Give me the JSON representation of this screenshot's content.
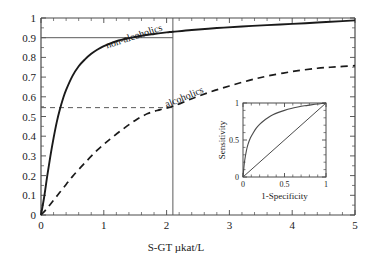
{
  "chart_data": [
    {
      "id": "main",
      "type": "line",
      "title": "",
      "xlabel": "S-GT µkat/L",
      "ylabel": "",
      "xlim": [
        0,
        5
      ],
      "ylim": [
        0,
        1
      ],
      "grid": false,
      "legend_position": "inline-curve-labels",
      "xticks": [
        0,
        1,
        2,
        3,
        4,
        5
      ],
      "xtick_labels": [
        "0",
        "1",
        "2",
        "3",
        "4",
        "5"
      ],
      "xminor_step": 0.2,
      "yticks": [
        0,
        0.1,
        0.2,
        0.3,
        0.4,
        0.5,
        0.6,
        0.7,
        0.8,
        0.9,
        1
      ],
      "ytick_labels": [
        "0",
        "0.1",
        "0.2",
        "0.3",
        "0.4",
        "0.5",
        "0.6",
        "0.7",
        "0.8",
        "0.9",
        "1"
      ],
      "yminor_step": 0.05,
      "series": [
        {
          "name": "non-alcoholics",
          "style": "solid",
          "label_text": "non-alcoholics",
          "label_rotation": -18,
          "x": [
            0,
            0.05,
            0.1,
            0.15,
            0.2,
            0.25,
            0.3,
            0.35,
            0.4,
            0.5,
            0.6,
            0.7,
            0.8,
            0.9,
            1.0,
            1.2,
            1.4,
            1.6,
            1.8,
            2.0,
            2.1,
            2.4,
            2.8,
            3.2,
            3.6,
            4.0,
            4.4,
            4.8,
            5.0
          ],
          "y": [
            0.0,
            0.09,
            0.2,
            0.3,
            0.39,
            0.47,
            0.535,
            0.59,
            0.635,
            0.705,
            0.755,
            0.79,
            0.818,
            0.84,
            0.857,
            0.882,
            0.898,
            0.91,
            0.919,
            0.927,
            0.93,
            0.939,
            0.949,
            0.957,
            0.964,
            0.97,
            0.977,
            0.984,
            0.988
          ]
        },
        {
          "name": "alcoholics",
          "style": "dashed",
          "label_text": "alcoholics",
          "label_rotation": -22,
          "x": [
            0,
            0.1,
            0.2,
            0.3,
            0.4,
            0.5,
            0.7,
            0.9,
            1.1,
            1.3,
            1.5,
            1.7,
            1.9,
            2.1,
            2.4,
            2.7,
            3.0,
            3.3,
            3.6,
            4.0,
            4.4,
            4.7,
            5.0
          ],
          "y": [
            0.0,
            0.035,
            0.075,
            0.115,
            0.155,
            0.195,
            0.265,
            0.33,
            0.385,
            0.435,
            0.48,
            0.515,
            0.535,
            0.552,
            0.59,
            0.625,
            0.655,
            0.682,
            0.705,
            0.728,
            0.745,
            0.752,
            0.758
          ]
        }
      ],
      "reference_lines": [
        {
          "name": "cutoff-vertical",
          "orientation": "vertical",
          "value": 2.1,
          "style": "solid",
          "y_from": 0,
          "y_to": 1
        },
        {
          "name": "non-alcoholics-level",
          "orientation": "horizontal",
          "value": 0.9,
          "style": "solid",
          "x_from": 0,
          "x_to": 2.1
        },
        {
          "name": "alcoholics-level",
          "orientation": "horizontal",
          "value": 0.545,
          "style": "dashed",
          "x_from": 0,
          "x_to": 2.1
        }
      ]
    },
    {
      "id": "inset",
      "type": "line",
      "title": "",
      "xlabel": "1-Specificity",
      "ylabel": "Sensitivity",
      "xlim": [
        0,
        1
      ],
      "ylim": [
        0,
        1
      ],
      "grid": false,
      "legend_position": "none",
      "xticks": [
        0,
        0.5,
        1
      ],
      "xtick_labels": [
        "0",
        "0.5",
        "1"
      ],
      "xminor_step": 0.1,
      "yticks": [
        0,
        0.5,
        1
      ],
      "ytick_labels": [
        "0",
        "0.5",
        "1"
      ],
      "yminor_step": 0.1,
      "series": [
        {
          "name": "ROC curve",
          "style": "solid",
          "x": [
            0,
            0.01,
            0.02,
            0.04,
            0.06,
            0.09,
            0.12,
            0.16,
            0.2,
            0.25,
            0.3,
            0.36,
            0.42,
            0.5,
            0.58,
            0.66,
            0.74,
            0.82,
            0.9,
            0.95,
            1.0
          ],
          "y": [
            0,
            0.12,
            0.22,
            0.35,
            0.44,
            0.53,
            0.59,
            0.66,
            0.71,
            0.76,
            0.8,
            0.84,
            0.87,
            0.9,
            0.925,
            0.945,
            0.962,
            0.975,
            0.987,
            0.993,
            1.0
          ]
        },
        {
          "name": "chance diagonal",
          "style": "solid",
          "x": [
            0,
            1
          ],
          "y": [
            0,
            1
          ]
        }
      ]
    }
  ]
}
